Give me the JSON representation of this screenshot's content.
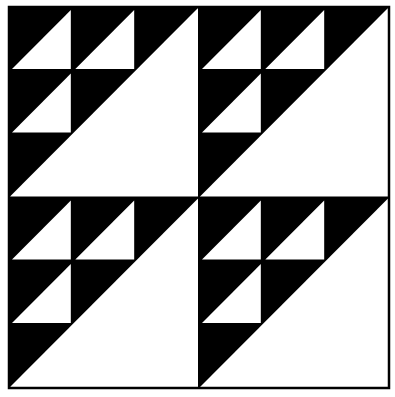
{
  "figure": {
    "title": "",
    "colors": {
      "dark": "#000000",
      "light": "#ffffff",
      "background": "#ffffff"
    },
    "layout": {
      "rows": 2,
      "cols": 2
    },
    "block": {
      "grid": 3,
      "large_triangle": "upper-left dark, lower-right light",
      "small_light_triangles": [
        {
          "row": 0,
          "col": 0
        },
        {
          "row": 0,
          "col": 1
        },
        {
          "row": 1,
          "col": 0
        }
      ]
    }
  }
}
